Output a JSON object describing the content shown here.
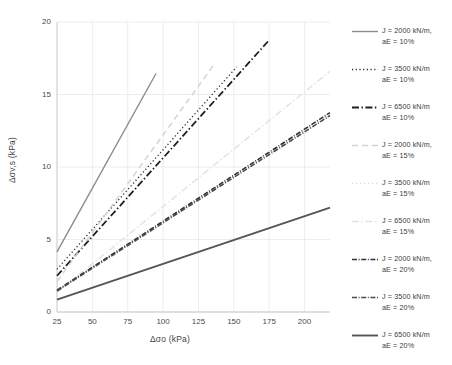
{
  "chart_data": {
    "type": "line",
    "title": "",
    "xlabel": "Δσo (kPa)",
    "ylabel": "Δσv,s (kPa)",
    "xlim": [
      25,
      218
    ],
    "ylim": [
      0,
      20
    ],
    "xticks": [
      25,
      50,
      75,
      100,
      125,
      150,
      175,
      200
    ],
    "yticks": [
      0,
      5,
      10,
      15,
      20
    ],
    "grid": true,
    "legend_position": "right",
    "series": [
      {
        "name": "J = 2000 kN/m,\naE = 10%",
        "label_line1": "J = 2000 kN/m,",
        "label_line2": "aE = 10%",
        "style": "solid",
        "color": "#8c8c8c",
        "width": 1.4,
        "x": [
          25,
          95
        ],
        "y": [
          4.15,
          16.45
        ]
      },
      {
        "name": "J = 3500 kN/m\naE = 10%",
        "label_line1": "J = 3500 kN/m",
        "label_line2": "aE = 10%",
        "style": "dotted",
        "color": "#2b2b2b",
        "width": 1.3,
        "x": [
          25,
          152
        ],
        "y": [
          2.95,
          16.9
        ]
      },
      {
        "name": "J = 6500 kN/m\naE = 10%",
        "label_line1": "J = 6500 kN/m",
        "label_line2": "aE = 10%",
        "style": "dashdot",
        "color": "#1f1f1f",
        "width": 1.8,
        "x": [
          25,
          175
        ],
        "y": [
          2.5,
          18.75
        ]
      },
      {
        "name": "J = 2000 kN/m,\naE = 15%",
        "label_line1": "J = 2000 kN/m,",
        "label_line2": "aE = 15%",
        "style": "dashed",
        "color": "#d4d4d4",
        "width": 1.5,
        "x": [
          25,
          137
        ],
        "y": [
          2.1,
          17.2
        ]
      },
      {
        "name": "J = 3500 kN/m\naE = 15%",
        "label_line1": "J = 3500 kN/m",
        "label_line2": "aE = 15%",
        "style": "dotted",
        "color": "#dcdcdc",
        "width": 1.4,
        "x": [
          25,
          218
        ],
        "y": [
          1.5,
          13.6
        ]
      },
      {
        "name": "J = 6500 kN/m\naE = 15%",
        "label_line1": "J = 6500 kN/m",
        "label_line2": "aE = 15%",
        "style": "dashdot",
        "color": "#e2e2e2",
        "width": 1.4,
        "x": [
          25,
          218
        ],
        "y": [
          1.35,
          16.6
        ]
      },
      {
        "name": "J = 2000 kN/m,\naE = 20%",
        "label_line1": "J = 2000 kN/m,",
        "label_line2": "aE = 20%",
        "style": "dashdot-dense",
        "color": "#333333",
        "width": 1.6,
        "x": [
          25,
          218
        ],
        "y": [
          1.5,
          13.75
        ]
      },
      {
        "name": "J = 3500 kN/m\naE = 20%",
        "label_line1": "J = 3500 kN/m",
        "label_line2": "aE = 20%",
        "style": "dashdot-dense",
        "color": "#4a4a4a",
        "width": 1.6,
        "x": [
          25,
          218
        ],
        "y": [
          1.45,
          13.55
        ]
      },
      {
        "name": "J = 6500 kN/m\naE = 20%",
        "label_line1": "J = 6500 kN/m",
        "label_line2": "aE = 20%",
        "style": "solid",
        "color": "#555555",
        "width": 1.9,
        "x": [
          25,
          218
        ],
        "y": [
          0.85,
          7.2
        ]
      }
    ]
  }
}
